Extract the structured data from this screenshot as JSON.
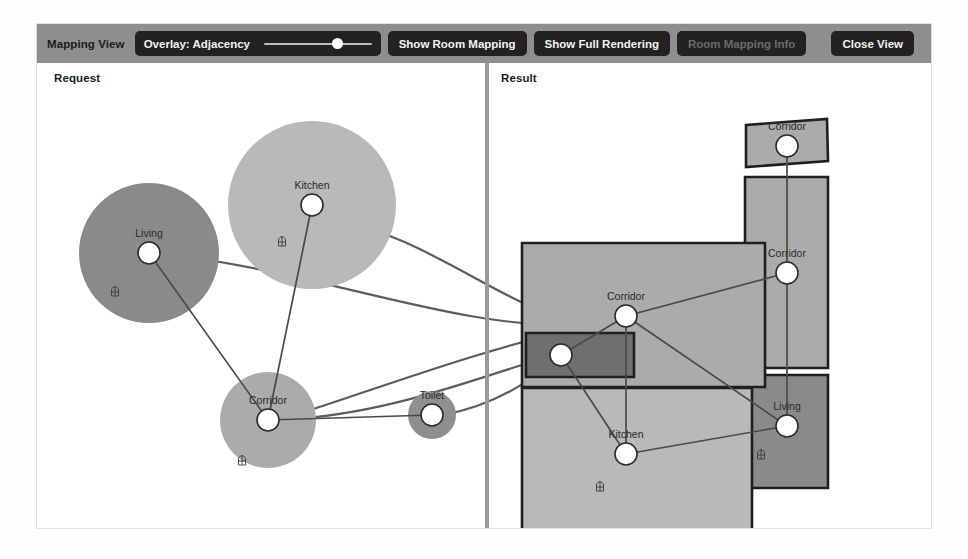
{
  "window": {
    "title": "Mapping View"
  },
  "toolbar": {
    "title": "Mapping View",
    "overlay_label": "Overlay: Adjacency",
    "overlay_slider_value": 68,
    "show_room_mapping_label": "Show Room Mapping",
    "show_full_rendering_label": "Show Full Rendering",
    "room_mapping_info_label": "Room Mapping Info",
    "room_mapping_info_disabled": true,
    "close_view_label": "Close View",
    "bar_color": "#8e8e8e",
    "button_color": "#222222"
  },
  "panes": {
    "left_title": "Request",
    "right_title": "Result"
  },
  "request_graph": {
    "type": "node-link",
    "nodes": [
      {
        "id": "living",
        "label": "Living",
        "cx": 112,
        "cy": 190,
        "bubble_r": 70,
        "ring_r": 11,
        "fill": "#8a8a8a",
        "door": true,
        "door_dx": -34,
        "door_dy": 38
      },
      {
        "id": "kitchen",
        "label": "Kitchen",
        "cx": 275,
        "cy": 142,
        "bubble_r": 84,
        "ring_r": 11,
        "fill": "#b9b9b9",
        "door": true,
        "door_dx": -30,
        "door_dy": 36
      },
      {
        "id": "corridor",
        "label": "Corridor",
        "cx": 231,
        "cy": 357,
        "bubble_r": 48,
        "ring_r": 11,
        "fill": "#ababab",
        "door": true,
        "door_dx": -26,
        "door_dy": 40
      },
      {
        "id": "toilet",
        "label": "Toilet",
        "cx": 395,
        "cy": 352,
        "bubble_r": 24,
        "ring_r": 11,
        "fill": "#8f8f8f",
        "door": false,
        "door_dx": 0,
        "door_dy": 0
      }
    ],
    "edges": [
      {
        "from": "living",
        "to": "corridor"
      },
      {
        "from": "kitchen",
        "to": "corridor"
      },
      {
        "from": "corridor",
        "to": "toilet"
      }
    ]
  },
  "result_graph": {
    "type": "floorplan",
    "rooms": [
      {
        "id": "corridor-top",
        "label": "Corridor",
        "points": "709,62 790,56 791,98 709,104",
        "fill": "#ababab",
        "node_cx": 750,
        "node_cy": 83,
        "ring_r": 11,
        "door": false,
        "door_dx": 0,
        "door_dy": 0
      },
      {
        "id": "corridor-tall",
        "label": "Corridor",
        "points": "708,114 791,114 791,305 708,305",
        "fill": "#ababab",
        "node_cx": 750,
        "node_cy": 210,
        "ring_r": 11,
        "door": false,
        "door_dx": 0,
        "door_dy": 0
      },
      {
        "id": "living",
        "label": "Living",
        "points": "708,312 791,312 791,425 708,425",
        "fill": "#8a8a8a",
        "node_cx": 750,
        "node_cy": 363,
        "ring_r": 11,
        "door": true,
        "door_dx": -26,
        "door_dy": 28
      },
      {
        "id": "corridor-main",
        "label": "Corridor",
        "points": "485,180 728,180 728,324 485,324",
        "fill": "#ababab",
        "node_cx": 589,
        "node_cy": 253,
        "ring_r": 11,
        "door": false,
        "door_dx": 0,
        "door_dy": 0
      },
      {
        "id": "kitchen",
        "label": "Kitchen",
        "points": "485,325 715,325 715,475 485,475",
        "fill": "#b9b9b9",
        "node_cx": 589,
        "node_cy": 391,
        "ring_r": 11,
        "door": true,
        "door_dx": -26,
        "door_dy": 32
      },
      {
        "id": "toilet",
        "label": "",
        "points": "489,270 597,270 597,314 489,314",
        "fill": "#6f6f6f",
        "node_cx": 524,
        "node_cy": 292,
        "ring_r": 11,
        "door": false,
        "door_dx": 0,
        "door_dy": 0
      }
    ],
    "edges": [
      {
        "from": "corridor-top",
        "to": "corridor-tall"
      },
      {
        "from": "corridor-tall",
        "to": "living"
      },
      {
        "from": "corridor-main",
        "to": "corridor-tall"
      },
      {
        "from": "corridor-main",
        "to": "toilet"
      },
      {
        "from": "corridor-main",
        "to": "kitchen"
      },
      {
        "from": "corridor-main",
        "to": "living"
      },
      {
        "from": "toilet",
        "to": "kitchen"
      },
      {
        "from": "kitchen",
        "to": "living"
      }
    ]
  },
  "mapping_links": {
    "description": "curved correspondence lines between Request nodes and Result nodes",
    "paths": [
      "M 286,153 C 400,175 470,250 553,262",
      "M 123,190 C 300,212 420,268 553,262",
      "M 242,357 C 330,330 430,290 553,262",
      "M 242,357 C 360,352 460,306 520,292",
      "M 406,352 C 470,340 510,305 520,292"
    ]
  },
  "colors": {
    "window_bg": "#ffffff",
    "toolbar_bg": "#8e8e8e",
    "divider": "#9a9a9a",
    "room_stroke": "#1f1f1f",
    "edge": "#4a4a4a",
    "node_ring_fill": "#ffffff",
    "label_text": "#2a2a2a"
  },
  "icons": {
    "door": "door-icon"
  }
}
